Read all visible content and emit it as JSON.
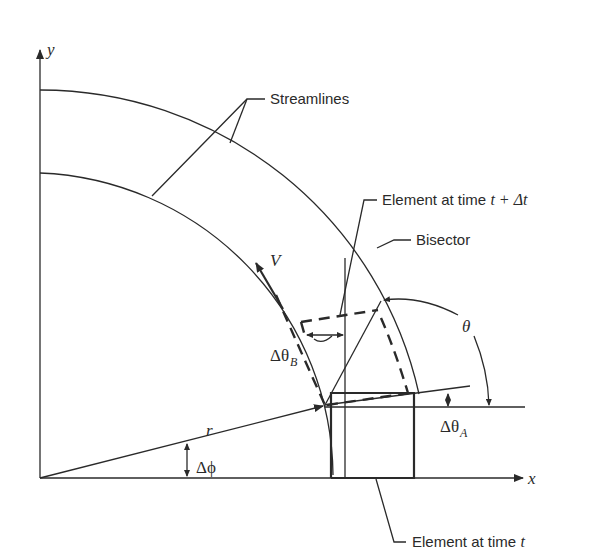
{
  "diagram": {
    "axes": {
      "x_label": "x",
      "y_label": "y"
    },
    "labels": {
      "streamlines": "Streamlines",
      "element_t_dt": "Element at time ",
      "element_t_dt_math": "t + Δt",
      "bisector": "Bisector",
      "element_t": "Element at time ",
      "element_t_math": "t",
      "velocity": "V",
      "theta": "θ",
      "delta_theta_b": "Δθ",
      "delta_theta_b_sub": "B",
      "delta_theta_a": "Δθ",
      "delta_theta_a_sub": "A",
      "radius": "r",
      "delta_phi": "Δϕ"
    },
    "colors": {
      "stroke": "#2a2a2a",
      "background": "#ffffff"
    }
  }
}
